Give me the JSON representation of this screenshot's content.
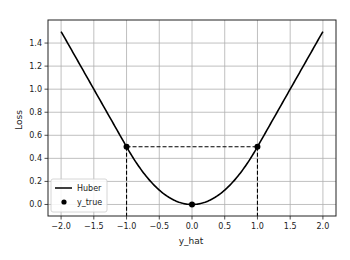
{
  "chart_data": {
    "type": "line",
    "title": "",
    "xlabel": "y_hat",
    "ylabel": "Loss",
    "xlim": [
      -2.2,
      2.2
    ],
    "ylim": [
      -0.1,
      1.6
    ],
    "grid": true,
    "legend_position": "lower left",
    "x_ticks": [
      -2.0,
      -1.5,
      -1.0,
      -0.5,
      0.0,
      0.5,
      1.0,
      1.5,
      2.0
    ],
    "x_tick_labels": [
      "−2.0",
      "−1.5",
      "−1.0",
      "−0.5",
      "0.0",
      "0.5",
      "1.0",
      "1.5",
      "2.0"
    ],
    "y_ticks": [
      0.0,
      0.2,
      0.4,
      0.6,
      0.8,
      1.0,
      1.2,
      1.4
    ],
    "y_tick_labels": [
      "0.0",
      "0.2",
      "0.4",
      "0.6",
      "0.8",
      "1.0",
      "1.2",
      "1.4"
    ],
    "series": [
      {
        "name": "Huber",
        "kind": "line",
        "color": "#000000",
        "x": [
          -2.0,
          -1.5,
          -1.0,
          -0.75,
          -0.5,
          -0.25,
          0.0,
          0.25,
          0.5,
          0.75,
          1.0,
          1.5,
          2.0
        ],
        "values": [
          1.5,
          1.0,
          0.5,
          0.28125,
          0.125,
          0.03125,
          0.0,
          0.03125,
          0.125,
          0.28125,
          0.5,
          1.0,
          1.5
        ]
      },
      {
        "name": "y_true",
        "kind": "scatter",
        "color": "#000000",
        "x": [
          -1.0,
          0.0,
          1.0
        ],
        "values": [
          0.5,
          0.0,
          0.5
        ]
      }
    ],
    "annotations": [
      {
        "type": "dashed-hline",
        "y": 0.5,
        "x_from": -1.0,
        "x_to": 1.0
      },
      {
        "type": "dashed-vline",
        "x": -1.0,
        "y_from": 0.5,
        "y_to": -0.1
      },
      {
        "type": "dashed-vline",
        "x": 1.0,
        "y_from": 0.5,
        "y_to": -0.1
      }
    ]
  },
  "legend": {
    "items": [
      {
        "label": "Huber",
        "marker": "line"
      },
      {
        "label": "y_true",
        "marker": "dot"
      }
    ]
  },
  "axes": {
    "xlabel": "y_hat",
    "ylabel": "Loss"
  }
}
